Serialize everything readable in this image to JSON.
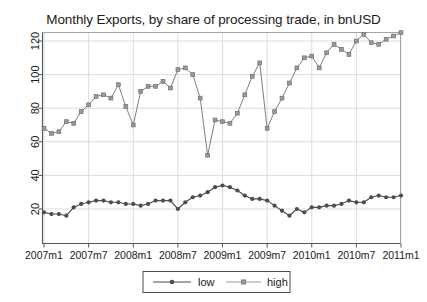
{
  "chart_data": {
    "type": "line",
    "title": "Monthly Exports, by share of processing trade, in bnUSD",
    "xlabel": "",
    "ylabel": "",
    "grid": true,
    "legend_position": "bottom",
    "xlim": [
      "2007m1",
      "2011m1"
    ],
    "ylim": [
      10,
      130
    ],
    "yticks": [
      20,
      40,
      60,
      80,
      100,
      120
    ],
    "ytick_labels": [
      "20",
      "40",
      "60",
      "80",
      "100",
      "120"
    ],
    "xticks": [
      "2007m1",
      "2007m7",
      "2008m1",
      "2008m7",
      "2009m1",
      "2009m7",
      "2010m1",
      "2010m7",
      "2011m1"
    ],
    "x": [
      "2007m1",
      "2007m2",
      "2007m3",
      "2007m4",
      "2007m5",
      "2007m6",
      "2007m7",
      "2007m8",
      "2007m9",
      "2007m10",
      "2007m11",
      "2007m12",
      "2008m1",
      "2008m2",
      "2008m3",
      "2008m4",
      "2008m5",
      "2008m6",
      "2008m7",
      "2008m8",
      "2008m9",
      "2008m10",
      "2008m11",
      "2008m12",
      "2009m1",
      "2009m2",
      "2009m3",
      "2009m4",
      "2009m5",
      "2009m6",
      "2009m7",
      "2009m8",
      "2009m9",
      "2009m10",
      "2009m11",
      "2009m12",
      "2010m1",
      "2010m2",
      "2010m3",
      "2010m4",
      "2010m5",
      "2010m6",
      "2010m7",
      "2010m8",
      "2010m9",
      "2010m10",
      "2010m11",
      "2010m12",
      "2011m1"
    ],
    "series": [
      {
        "name": "low",
        "color": "#4d4d4d",
        "values": [
          18,
          17,
          17,
          16,
          21,
          23,
          24,
          25,
          25,
          24,
          24,
          23,
          23,
          22,
          23,
          25,
          25,
          25,
          20,
          24,
          27,
          28,
          30,
          33,
          34,
          33,
          31,
          28,
          26,
          26,
          25,
          22,
          19,
          16,
          20,
          18,
          21,
          21,
          22,
          22,
          23,
          25,
          24,
          24,
          27,
          28,
          27,
          27,
          28
        ]
      },
      {
        "name": "high",
        "color": "#808080",
        "values": [
          68,
          65,
          66,
          72,
          71,
          78,
          82,
          87,
          88,
          86,
          94,
          81,
          70,
          90,
          93,
          93,
          96,
          92,
          103,
          104,
          100,
          86,
          52,
          73,
          72,
          71,
          77,
          88,
          99,
          107,
          68,
          78,
          86,
          95,
          104,
          110,
          111,
          104,
          113,
          118,
          115,
          112,
          120,
          124,
          119,
          118,
          121,
          123,
          125
        ]
      }
    ]
  },
  "legend": {
    "items": [
      {
        "label": "low"
      },
      {
        "label": "high"
      }
    ]
  },
  "axes": {
    "left_frame": true,
    "bottom_frame": true
  }
}
